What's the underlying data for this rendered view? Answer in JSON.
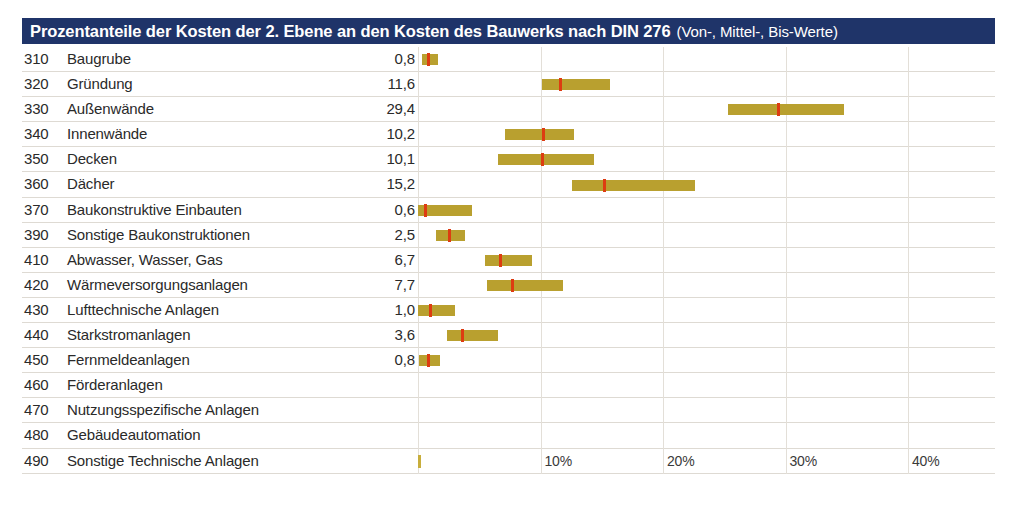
{
  "title": {
    "main": "Prozentanteile der Kosten der 2. Ebene an den Kosten des Bauwerks nach DIN 276",
    "suffix": "(Von-, Mittel-, Bis-Werte)"
  },
  "colors": {
    "header_bg": "#1f3469",
    "header_text": "#ffffff",
    "bar": "#b9a02f",
    "marker": "#dd3c11",
    "gridline": "#e3dfd8",
    "row_separator": "#dedad3",
    "text": "#2a2a2a"
  },
  "chart_data": {
    "type": "bar",
    "title": "Prozentanteile der Kosten der 2. Ebene an den Kosten des Bauwerks nach DIN 276",
    "subtitle": "(Von-, Mittel-, Bis-Werte)",
    "xlabel": "",
    "ylabel": "",
    "xlim": [
      0,
      46.5
    ],
    "grid": true,
    "legend": null,
    "xticks": [
      0,
      10,
      20,
      30,
      40
    ],
    "xtick_labels": [
      "",
      "10%",
      "20%",
      "30%",
      "40%"
    ],
    "value_column_header": "",
    "rows": [
      {
        "code": "310",
        "label": "Baugrube",
        "value": "0,8",
        "mid": 0.8,
        "von": 0.3,
        "bis": 1.6
      },
      {
        "code": "320",
        "label": "Gründung",
        "value": "11,6",
        "mid": 11.6,
        "von": 10.1,
        "bis": 15.7
      },
      {
        "code": "330",
        "label": "Außenwände",
        "value": "29,4",
        "mid": 29.4,
        "von": 25.3,
        "bis": 34.8
      },
      {
        "code": "340",
        "label": "Innenwände",
        "value": "10,2",
        "mid": 10.2,
        "von": 7.1,
        "bis": 12.7
      },
      {
        "code": "350",
        "label": "Decken",
        "value": "10,1",
        "mid": 10.1,
        "von": 6.5,
        "bis": 14.4
      },
      {
        "code": "360",
        "label": "Dächer",
        "value": "15,2",
        "mid": 15.2,
        "von": 12.6,
        "bis": 22.6
      },
      {
        "code": "370",
        "label": "Baukonstruktive Einbauten",
        "value": "0,6",
        "mid": 0.6,
        "von": 0.0,
        "bis": 4.4
      },
      {
        "code": "390",
        "label": "Sonstige Baukonstruktionen",
        "value": "2,5",
        "mid": 2.5,
        "von": 1.5,
        "bis": 3.8
      },
      {
        "code": "410",
        "label": "Abwasser, Wasser, Gas",
        "value": "6,7",
        "mid": 6.7,
        "von": 5.5,
        "bis": 9.3
      },
      {
        "code": "420",
        "label": "Wärmeversorgungsanlagen",
        "value": "7,7",
        "mid": 7.7,
        "von": 5.6,
        "bis": 11.8
      },
      {
        "code": "430",
        "label": "Lufttechnische Anlagen",
        "value": "1,0",
        "mid": 1.0,
        "von": 0.0,
        "bis": 3.0
      },
      {
        "code": "440",
        "label": "Starkstromanlagen",
        "value": "3,6",
        "mid": 3.6,
        "von": 2.4,
        "bis": 6.5
      },
      {
        "code": "450",
        "label": "Fernmeldeanlagen",
        "value": "0,8",
        "mid": 0.8,
        "von": 0.1,
        "bis": 1.8
      },
      {
        "code": "460",
        "label": "Förderanlagen",
        "value": "",
        "mid": null,
        "von": null,
        "bis": null
      },
      {
        "code": "470",
        "label": "Nutzungsspezifische Anlagen",
        "value": "",
        "mid": null,
        "von": null,
        "bis": null
      },
      {
        "code": "480",
        "label": "Gebäudeautomation",
        "value": "",
        "mid": null,
        "von": null,
        "bis": null
      },
      {
        "code": "490",
        "label": "Sonstige Technische Anlagen",
        "value": "",
        "mid": null,
        "von": null,
        "bis": null
      }
    ]
  }
}
